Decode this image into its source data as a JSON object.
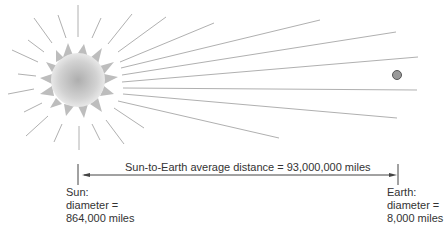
{
  "diagram": {
    "distance_label": "Sun-to-Earth average distance = 93,000,000 miles",
    "sun": {
      "name": "Sun:",
      "diameter_label": "diameter =",
      "diameter_value": "864,000 miles"
    },
    "earth": {
      "name": "Earth:",
      "diameter_label": "diameter =",
      "diameter_value": "8,000 miles"
    },
    "colors": {
      "ray": "#aaaaaa",
      "spike": "#bbbbbb",
      "sun_center": "#b0b0b0",
      "sun_edge": "#e6e6e6",
      "earth_fill": "#999999",
      "earth_stroke": "#555555",
      "arrow": "#444444",
      "text": "#333333"
    }
  }
}
